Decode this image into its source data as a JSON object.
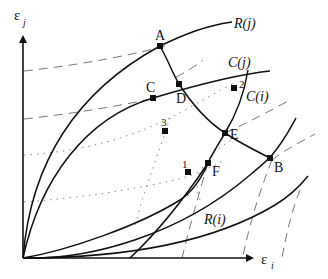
{
  "diagram": {
    "axes": {
      "y_label": "ε",
      "y_sub": "j",
      "x_label": "ε",
      "x_sub": "i"
    },
    "curves": {
      "R_j": "R(j)",
      "C_j": "C(j)",
      "C_i": "C(i)",
      "R_i": "R(i)"
    },
    "points": {
      "A": "A",
      "B": "B",
      "C": "C",
      "D": "D",
      "E": "E",
      "F": "F",
      "p1": "1",
      "p2": "2",
      "p3": "3"
    },
    "colors": {
      "ink": "#111111",
      "dashed": "#777777",
      "dotted": "#888888"
    }
  }
}
